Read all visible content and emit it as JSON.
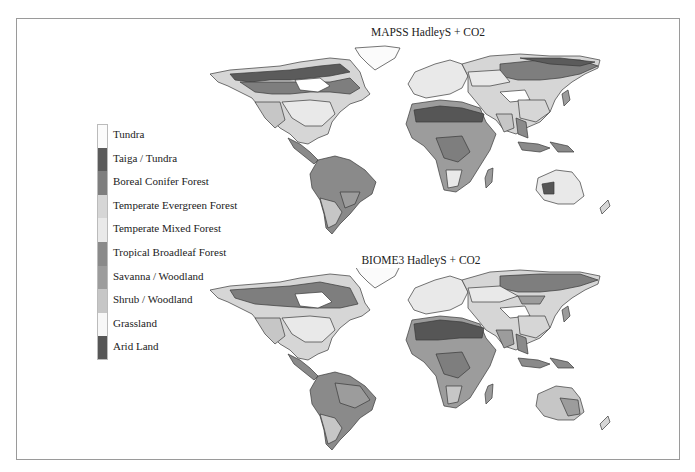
{
  "figure": {
    "panels": [
      {
        "id": "top",
        "title": "MAPSS HadleyS + CO2"
      },
      {
        "id": "bottom",
        "title": "BIOME3 HadleyS + CO2"
      }
    ]
  },
  "legend": {
    "items": [
      {
        "label": "Tundra",
        "color": "#fbfbfb"
      },
      {
        "label": "Taiga / Tundra",
        "color": "#5b5b5b"
      },
      {
        "label": "Boreal Conifer Forest",
        "color": "#7e7e7e"
      },
      {
        "label": "Temperate Evergreen Forest",
        "color": "#d6d6d6"
      },
      {
        "label": "Temperate Mixed Forest",
        "color": "#e9e9e9"
      },
      {
        "label": "Tropical Broadleaf Forest",
        "color": "#8a8a8a"
      },
      {
        "label": "Savanna / Woodland",
        "color": "#9c9c9c"
      },
      {
        "label": "Shrub / Woodland",
        "color": "#c6c6c6"
      },
      {
        "label": "Grassland",
        "color": "#f7f7f7"
      },
      {
        "label": "Arid Land",
        "color": "#565656"
      }
    ]
  },
  "colors": {
    "frame_border": "#9a9a9a",
    "coast": "#3a3a3a",
    "background": "#ffffff"
  }
}
